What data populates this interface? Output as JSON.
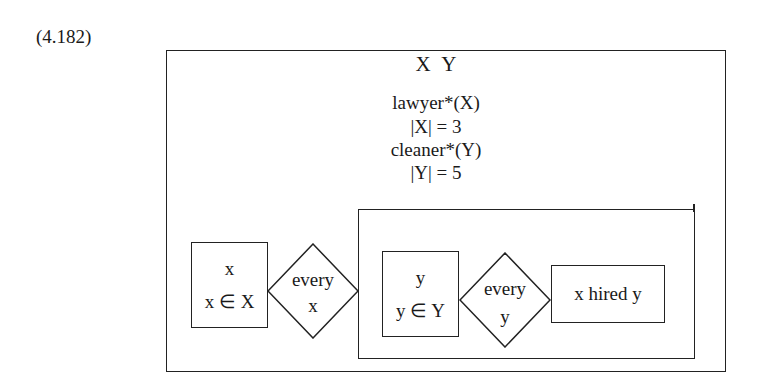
{
  "equation_number": "(4.182)",
  "drs": {
    "discourse_referents": "X  Y",
    "conditions": [
      "lawyer*(X)",
      "|X| = 3",
      "cleaner*(Y)",
      "|Y| = 5"
    ],
    "outer_duplex": {
      "restrictor": {
        "referent": "x",
        "condition": "x ∈ X"
      },
      "quantifier": {
        "label": "every",
        "variable": "x"
      },
      "scope": {
        "restrictor": {
          "referent": "y",
          "condition": "y ∈ Y"
        },
        "quantifier": {
          "label": "every",
          "variable": "y"
        },
        "nuclear": {
          "condition": "x hired y"
        }
      }
    }
  }
}
